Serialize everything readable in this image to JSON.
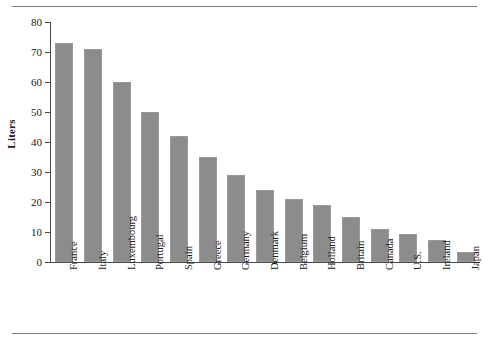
{
  "chart_data": {
    "type": "bar",
    "title": "",
    "xlabel": "",
    "ylabel": "Liters",
    "ylim": [
      0,
      80
    ],
    "ytick_values": [
      0,
      10,
      20,
      30,
      40,
      50,
      60,
      70,
      80
    ],
    "ytick_labels": [
      "0",
      "10",
      "20",
      "30",
      "40",
      "50",
      "60",
      "70",
      "80"
    ],
    "grid": false,
    "legend": false,
    "bar_color": "#8c8c8c",
    "categories": [
      "France",
      "Italy",
      "Luxembourg",
      "Portugal",
      "Spain",
      "Greece",
      "Germany",
      "Denmark",
      "Belgium",
      "Holland",
      "Britain",
      "Canada",
      "U.S.",
      "Ireland",
      "Japan"
    ],
    "values": [
      73,
      71,
      60,
      50,
      42,
      35,
      29,
      24,
      21,
      19,
      15,
      11,
      9.5,
      7.5,
      3.5
    ]
  },
  "figure": {
    "ylabel_text": "Liters"
  }
}
